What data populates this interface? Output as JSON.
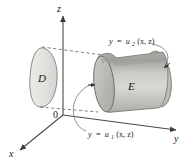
{
  "figure": {
    "axes": {
      "z_label": "z",
      "y_label": "y",
      "x_label": "x",
      "origin_label": "0"
    },
    "regions": {
      "projection_label": "D",
      "solid_label": "E"
    },
    "surface_labels": {
      "upper": {
        "lhs": "y",
        "eq": "=",
        "fn": "u",
        "sub": "2",
        "args": "(x, z)",
        "full": "y = u2(x, z)"
      },
      "lower": {
        "lhs": "y",
        "eq": "=",
        "fn": "u",
        "sub": "1",
        "args": "(x, z)",
        "full": "y = u1(x, z)"
      }
    },
    "colors": {
      "ink": "#1b1b1b",
      "axis": "#4a4a4a",
      "dashed": "#6d6d6d",
      "leader": "#7a7a7a",
      "surface_light": "#d7d6d2",
      "surface_mid": "#c2c1bc",
      "surface_dark": "#a9a8a3",
      "cap_fill": "#cfcecA",
      "d_fill": "#e2e1dd",
      "background": "#ffffff"
    }
  }
}
